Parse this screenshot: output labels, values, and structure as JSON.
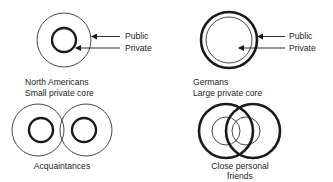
{
  "panels": {
    "north_americans": {
      "title": "North Americans",
      "subtitle": "Small private core",
      "public_label": "Public",
      "private_label": "Private"
    },
    "germans": {
      "title": "Germans",
      "subtitle": "Large private core",
      "public_label": "Public",
      "private_label": "Private"
    },
    "acquaintances": {
      "caption": "Acquaintances"
    },
    "close_friends": {
      "caption_line1": "Close personal",
      "caption_line2": "friends"
    }
  },
  "colors": {
    "stroke": "#1a1a1a",
    "background": "#ffffff"
  }
}
